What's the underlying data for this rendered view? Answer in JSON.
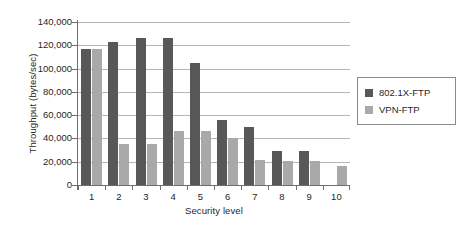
{
  "chart_data": {
    "type": "bar",
    "title": "",
    "subtitle": "",
    "xlabel": "Security level",
    "ylabel": "Throughput (bytes/sec)",
    "categories": [
      "1",
      "2",
      "3",
      "4",
      "5",
      "6",
      "7",
      "8",
      "9",
      "10"
    ],
    "series": [
      {
        "name": "802.1X-FTP",
        "color": "#585858",
        "values": [
          117000,
          122500,
          126500,
          126000,
          105000,
          55500,
          49500,
          29000,
          29000,
          null
        ]
      },
      {
        "name": "VPN-FTP",
        "color": "#a9a9a9",
        "values": [
          117000,
          35500,
          35500,
          46000,
          46000,
          40000,
          21500,
          21000,
          21000,
          16000
        ]
      }
    ],
    "ylim": [
      0,
      140000
    ],
    "ytick_values": [
      0,
      20000,
      40000,
      60000,
      80000,
      100000,
      120000,
      140000
    ],
    "ytick_labels": [
      "0",
      "20,000",
      "40,000",
      "60,000",
      "80,000",
      "100,000",
      "120,000",
      "140,000"
    ],
    "grid": true,
    "grid_axis": "y",
    "legend_position": "right",
    "legend_entries": [
      "802.1X-FTP",
      "VPN-FTP"
    ]
  }
}
